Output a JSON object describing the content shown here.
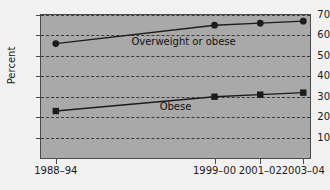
{
  "chart_data": {
    "type": "line",
    "title": "",
    "xlabel": "",
    "ylabel": "Percent",
    "categories": [
      "1988–94",
      "1999–00",
      "2001–02",
      "2003–04"
    ],
    "ylim": [
      0,
      70
    ],
    "yticks": [
      10,
      20,
      30,
      40,
      50,
      60,
      70
    ],
    "grid": true,
    "legend_position": "inline-annotation",
    "series": [
      {
        "name": "Overweight or obese",
        "marker": "circle",
        "color": "#1c1c1c",
        "values": [
          56,
          65,
          66,
          67
        ]
      },
      {
        "name": "Obese",
        "marker": "square",
        "color": "#1c1c1c",
        "values": [
          23,
          30,
          31,
          32
        ]
      }
    ],
    "annotations": [
      {
        "text": "Overweight or obese",
        "x_frac": 0.53,
        "y_value": 57.5
      },
      {
        "text": "Obese",
        "x_frac": 0.5,
        "y_value": 25.5
      }
    ]
  },
  "colors": {
    "plot_background": "#a9a9a9",
    "page_background": "#f1f1f1",
    "grid": "#3a3a3a",
    "axis": "#4a4a4a",
    "series": "#1c1c1c"
  },
  "axes": {
    "y_tick_labels": [
      "10",
      "20",
      "30",
      "40",
      "50",
      "60",
      "70"
    ],
    "x_tick_labels": [
      "1988–94",
      "1999–00",
      "2001–02",
      "2003–04"
    ],
    "y_axis_title": "Percent"
  }
}
